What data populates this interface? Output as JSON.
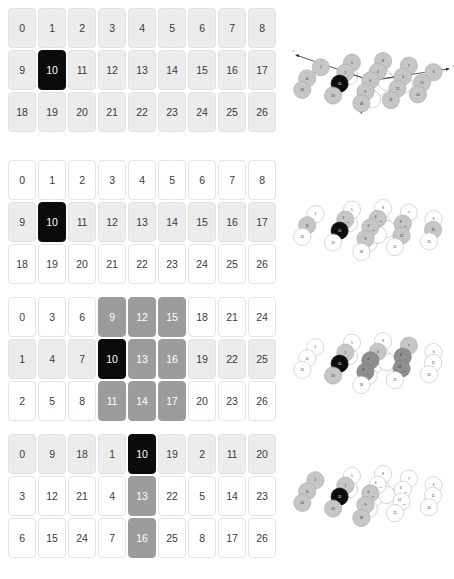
{
  "panels": [
    {
      "id": "panel-1",
      "order": "row-major-x",
      "rows": [
        [
          {
            "v": "0",
            "s": "lite"
          },
          {
            "v": "1",
            "s": "lite"
          },
          {
            "v": "2",
            "s": "lite"
          },
          {
            "v": "3",
            "s": "lite"
          },
          {
            "v": "4",
            "s": "lite"
          },
          {
            "v": "5",
            "s": "lite"
          },
          {
            "v": "6",
            "s": "lite"
          },
          {
            "v": "7",
            "s": "lite"
          },
          {
            "v": "8",
            "s": "lite"
          }
        ],
        [
          {
            "v": "9",
            "s": "lite"
          },
          {
            "v": "10",
            "s": "dark"
          },
          {
            "v": "11",
            "s": "lite"
          },
          {
            "v": "12",
            "s": "lite"
          },
          {
            "v": "13",
            "s": "lite"
          },
          {
            "v": "14",
            "s": "lite"
          },
          {
            "v": "15",
            "s": "lite"
          },
          {
            "v": "16",
            "s": "lite"
          },
          {
            "v": "17",
            "s": "lite"
          }
        ],
        [
          {
            "v": "18",
            "s": "lite"
          },
          {
            "v": "19",
            "s": "lite"
          },
          {
            "v": "20",
            "s": "lite"
          },
          {
            "v": "21",
            "s": "lite"
          },
          {
            "v": "22",
            "s": "lite"
          },
          {
            "v": "23",
            "s": "lite"
          },
          {
            "v": "24",
            "s": "lite"
          },
          {
            "v": "25",
            "s": "lite"
          },
          {
            "v": "26",
            "s": "lite"
          }
        ]
      ]
    },
    {
      "id": "panel-2",
      "order": "row-major-x",
      "rows": [
        [
          {
            "v": "0",
            "s": "plain"
          },
          {
            "v": "1",
            "s": "plain"
          },
          {
            "v": "2",
            "s": "plain"
          },
          {
            "v": "3",
            "s": "plain"
          },
          {
            "v": "4",
            "s": "plain"
          },
          {
            "v": "5",
            "s": "plain"
          },
          {
            "v": "6",
            "s": "plain"
          },
          {
            "v": "7",
            "s": "plain"
          },
          {
            "v": "8",
            "s": "plain"
          }
        ],
        [
          {
            "v": "9",
            "s": "lite"
          },
          {
            "v": "10",
            "s": "dark"
          },
          {
            "v": "11",
            "s": "lite"
          },
          {
            "v": "12",
            "s": "lite"
          },
          {
            "v": "13",
            "s": "lite"
          },
          {
            "v": "14",
            "s": "lite"
          },
          {
            "v": "15",
            "s": "lite"
          },
          {
            "v": "16",
            "s": "lite"
          },
          {
            "v": "17",
            "s": "lite"
          }
        ],
        [
          {
            "v": "18",
            "s": "plain"
          },
          {
            "v": "19",
            "s": "plain"
          },
          {
            "v": "20",
            "s": "plain"
          },
          {
            "v": "21",
            "s": "plain"
          },
          {
            "v": "22",
            "s": "plain"
          },
          {
            "v": "23",
            "s": "plain"
          },
          {
            "v": "24",
            "s": "plain"
          },
          {
            "v": "25",
            "s": "plain"
          },
          {
            "v": "26",
            "s": "plain"
          }
        ]
      ]
    },
    {
      "id": "panel-3",
      "order": "column-major",
      "rows": [
        [
          {
            "v": "0",
            "s": "plain"
          },
          {
            "v": "3",
            "s": "plain"
          },
          {
            "v": "6",
            "s": "plain"
          },
          {
            "v": "9",
            "s": "mid"
          },
          {
            "v": "12",
            "s": "mid"
          },
          {
            "v": "15",
            "s": "mid"
          },
          {
            "v": "18",
            "s": "plain"
          },
          {
            "v": "21",
            "s": "plain"
          },
          {
            "v": "24",
            "s": "plain"
          }
        ],
        [
          {
            "v": "1",
            "s": "lite"
          },
          {
            "v": "4",
            "s": "lite"
          },
          {
            "v": "7",
            "s": "lite"
          },
          {
            "v": "10",
            "s": "dark"
          },
          {
            "v": "13",
            "s": "mid"
          },
          {
            "v": "16",
            "s": "mid"
          },
          {
            "v": "19",
            "s": "lite"
          },
          {
            "v": "22",
            "s": "lite"
          },
          {
            "v": "25",
            "s": "lite"
          }
        ],
        [
          {
            "v": "2",
            "s": "plain"
          },
          {
            "v": "5",
            "s": "plain"
          },
          {
            "v": "8",
            "s": "plain"
          },
          {
            "v": "11",
            "s": "mid"
          },
          {
            "v": "14",
            "s": "mid"
          },
          {
            "v": "17",
            "s": "mid"
          },
          {
            "v": "20",
            "s": "plain"
          },
          {
            "v": "23",
            "s": "plain"
          },
          {
            "v": "26",
            "s": "plain"
          }
        ]
      ]
    },
    {
      "id": "panel-4",
      "order": "depth-major",
      "rows": [
        [
          {
            "v": "0",
            "s": "lite"
          },
          {
            "v": "9",
            "s": "lite"
          },
          {
            "v": "18",
            "s": "lite"
          },
          {
            "v": "1",
            "s": "lite"
          },
          {
            "v": "10",
            "s": "dark"
          },
          {
            "v": "19",
            "s": "lite"
          },
          {
            "v": "2",
            "s": "lite"
          },
          {
            "v": "11",
            "s": "lite"
          },
          {
            "v": "20",
            "s": "lite"
          }
        ],
        [
          {
            "v": "3",
            "s": "plain"
          },
          {
            "v": "12",
            "s": "plain"
          },
          {
            "v": "21",
            "s": "plain"
          },
          {
            "v": "4",
            "s": "plain"
          },
          {
            "v": "13",
            "s": "mid"
          },
          {
            "v": "22",
            "s": "plain"
          },
          {
            "v": "5",
            "s": "plain"
          },
          {
            "v": "14",
            "s": "plain"
          },
          {
            "v": "23",
            "s": "plain"
          }
        ],
        [
          {
            "v": "6",
            "s": "plain"
          },
          {
            "v": "15",
            "s": "plain"
          },
          {
            "v": "24",
            "s": "plain"
          },
          {
            "v": "7",
            "s": "plain"
          },
          {
            "v": "16",
            "s": "mid"
          },
          {
            "v": "25",
            "s": "plain"
          },
          {
            "v": "8",
            "s": "plain"
          },
          {
            "v": "17",
            "s": "plain"
          },
          {
            "v": "26",
            "s": "plain"
          }
        ]
      ]
    }
  ],
  "axes": {
    "x": "x",
    "y": "Y",
    "z": "z"
  },
  "diagrams": [
    {
      "id": "diagram-1",
      "has_axes": true,
      "nodes": [
        {
          "id": "8",
          "x": 227,
          "y": 29,
          "s": "lite"
        },
        {
          "id": "5",
          "x": 151,
          "y": 33,
          "s": "lite"
        },
        {
          "id": "7",
          "x": 290,
          "y": 40,
          "s": "lite"
        },
        {
          "id": "2",
          "x": 75,
          "y": 44,
          "s": "lite"
        },
        {
          "id": "4",
          "x": 214,
          "y": 55,
          "s": "lite"
        },
        {
          "id": "1",
          "x": 135,
          "y": 57,
          "s": "lite"
        },
        {
          "id": "6",
          "x": 350,
          "y": 56,
          "s": "lite"
        },
        {
          "id": "3",
          "x": 275,
          "y": 67,
          "s": "lite"
        },
        {
          "id": "0",
          "x": 196,
          "y": 76,
          "s": "lite"
        },
        {
          "id": "11",
          "x": 42,
          "y": 71,
          "s": "lite"
        },
        {
          "id": "10",
          "x": 121,
          "y": 84,
          "s": "blk"
        },
        {
          "id": "15",
          "x": 322,
          "y": 82,
          "s": "lite"
        },
        {
          "id": "12",
          "x": 262,
          "y": 96,
          "s": "lite"
        },
        {
          "id": "9",
          "x": 184,
          "y": 104,
          "s": "lite"
        },
        {
          "id": "20",
          "x": 30,
          "y": 99,
          "s": "lite"
        },
        {
          "id": "19",
          "x": 105,
          "y": 113,
          "s": "lite"
        },
        {
          "id": "24",
          "x": 312,
          "y": 110,
          "s": "lite"
        },
        {
          "id": "21",
          "x": 246,
          "y": 124,
          "s": "lite"
        },
        {
          "id": "18",
          "x": 174,
          "y": 132,
          "s": "lite"
        }
      ],
      "ghosts": [
        {
          "x": 222,
          "y": 64
        },
        {
          "x": 230,
          "y": 72
        },
        {
          "x": 206,
          "y": 86
        },
        {
          "x": 214,
          "y": 94
        },
        {
          "x": 270,
          "y": 78
        },
        {
          "x": 278,
          "y": 86
        },
        {
          "x": 192,
          "y": 114
        },
        {
          "x": 200,
          "y": 122
        },
        {
          "x": 144,
          "y": 66
        },
        {
          "x": 236,
          "y": 80
        }
      ]
    },
    {
      "id": "diagram-2",
      "has_axes": false,
      "nodes": [
        {
          "id": "8",
          "x": 227,
          "y": 29,
          "s": "plain"
        },
        {
          "id": "5",
          "x": 151,
          "y": 33,
          "s": "plain"
        },
        {
          "id": "7",
          "x": 290,
          "y": 40,
          "s": "plain"
        },
        {
          "id": "2",
          "x": 62,
          "y": 44,
          "s": "plain"
        },
        {
          "id": "4",
          "x": 214,
          "y": 55,
          "s": "lite",
          "sub": "17"
        },
        {
          "id": "1",
          "x": 135,
          "y": 57,
          "s": "lite",
          "sub": "14"
        },
        {
          "id": "6",
          "x": 350,
          "y": 56,
          "s": "plain"
        },
        {
          "id": "3",
          "x": 275,
          "y": 67,
          "s": "lite",
          "sub": "16"
        },
        {
          "id": "0",
          "x": 196,
          "y": 76,
          "s": "lite",
          "sub": "13"
        },
        {
          "id": "11",
          "x": 42,
          "y": 71,
          "s": "lite"
        },
        {
          "id": "10",
          "x": 121,
          "y": 84,
          "s": "blk"
        },
        {
          "id": "15",
          "x": 349,
          "y": 82,
          "s": "lite"
        },
        {
          "id": "12",
          "x": 272,
          "y": 96,
          "s": "lite"
        },
        {
          "id": "9",
          "x": 184,
          "y": 104,
          "s": "lite"
        },
        {
          "id": "20",
          "x": 30,
          "y": 99,
          "s": "plain"
        },
        {
          "id": "19",
          "x": 105,
          "y": 113,
          "s": "plain"
        },
        {
          "id": "24",
          "x": 339,
          "y": 110,
          "s": "plain"
        },
        {
          "id": "21",
          "x": 256,
          "y": 124,
          "s": "plain"
        },
        {
          "id": "18",
          "x": 174,
          "y": 136,
          "s": "plain"
        }
      ],
      "ghosts": [
        {
          "x": 222,
          "y": 64
        },
        {
          "x": 206,
          "y": 86
        },
        {
          "x": 270,
          "y": 78
        },
        {
          "x": 192,
          "y": 114
        },
        {
          "x": 144,
          "y": 66
        },
        {
          "x": 236,
          "y": 80
        },
        {
          "x": 214,
          "y": 94
        }
      ]
    },
    {
      "id": "diagram-3",
      "has_axes": false,
      "nodes": [
        {
          "id": "8",
          "x": 227,
          "y": 29,
          "s": "plain"
        },
        {
          "id": "5",
          "x": 151,
          "y": 33,
          "s": "plain"
        },
        {
          "id": "7",
          "x": 290,
          "y": 40,
          "s": "lite"
        },
        {
          "id": "2",
          "x": 62,
          "y": 44,
          "s": "plain"
        },
        {
          "id": "4",
          "x": 214,
          "y": 55,
          "s": "lite"
        },
        {
          "id": "1",
          "x": 135,
          "y": 57,
          "s": "lite"
        },
        {
          "id": "6",
          "x": 350,
          "y": 56,
          "s": "plain"
        },
        {
          "id": "3",
          "x": 275,
          "y": 67,
          "s": "mid",
          "sub": "6"
        },
        {
          "id": "0",
          "x": 196,
          "y": 76,
          "s": "mid",
          "sub": "4"
        },
        {
          "id": "11",
          "x": 42,
          "y": 71,
          "s": "plain"
        },
        {
          "id": "10",
          "x": 121,
          "y": 84,
          "s": "blk"
        },
        {
          "id": "15",
          "x": 349,
          "y": 82,
          "s": "plain"
        },
        {
          "id": "12",
          "x": 272,
          "y": 96,
          "s": "mid",
          "sub": "28"
        },
        {
          "id": "9",
          "x": 184,
          "y": 104,
          "s": "mid",
          "sub": "24"
        },
        {
          "id": "20",
          "x": 30,
          "y": 99,
          "s": "plain"
        },
        {
          "id": "19",
          "x": 105,
          "y": 113,
          "s": "lite"
        },
        {
          "id": "24",
          "x": 339,
          "y": 110,
          "s": "plain"
        },
        {
          "id": "21",
          "x": 256,
          "y": 124,
          "s": "plain"
        },
        {
          "id": "18",
          "x": 174,
          "y": 136,
          "s": "plain"
        }
      ],
      "ghosts": [
        {
          "x": 222,
          "y": 64
        },
        {
          "x": 206,
          "y": 86
        },
        {
          "x": 270,
          "y": 78
        },
        {
          "x": 192,
          "y": 114
        },
        {
          "x": 144,
          "y": 66
        },
        {
          "x": 236,
          "y": 80
        }
      ]
    },
    {
      "id": "diagram-4",
      "has_axes": false,
      "nodes": [
        {
          "id": "8",
          "x": 227,
          "y": 29,
          "s": "plain"
        },
        {
          "id": "5",
          "x": 151,
          "y": 33,
          "s": "plain"
        },
        {
          "id": "7",
          "x": 290,
          "y": 40,
          "s": "plain"
        },
        {
          "id": "2",
          "x": 62,
          "y": 44,
          "s": "lite"
        },
        {
          "id": "4",
          "x": 214,
          "y": 55,
          "s": "plain",
          "sub": "17"
        },
        {
          "id": "1",
          "x": 135,
          "y": 57,
          "s": "lite"
        },
        {
          "id": "6",
          "x": 350,
          "y": 56,
          "s": "plain"
        },
        {
          "id": "3",
          "x": 275,
          "y": 67,
          "s": "plain",
          "sub": "16"
        },
        {
          "id": "0",
          "x": 196,
          "y": 76,
          "s": "lite",
          "sub": "26"
        },
        {
          "id": "11",
          "x": 42,
          "y": 71,
          "s": "lite"
        },
        {
          "id": "10",
          "x": 121,
          "y": 84,
          "s": "blk"
        },
        {
          "id": "15",
          "x": 349,
          "y": 82,
          "s": "plain"
        },
        {
          "id": "12",
          "x": 272,
          "y": 96,
          "s": "plain",
          "sub": "25"
        },
        {
          "id": "9",
          "x": 184,
          "y": 104,
          "s": "lite"
        },
        {
          "id": "20",
          "x": 30,
          "y": 99,
          "s": "lite"
        },
        {
          "id": "19",
          "x": 105,
          "y": 113,
          "s": "lite"
        },
        {
          "id": "24",
          "x": 339,
          "y": 110,
          "s": "plain"
        },
        {
          "id": "21",
          "x": 256,
          "y": 124,
          "s": "plain"
        },
        {
          "id": "18",
          "x": 174,
          "y": 136,
          "s": "lite"
        }
      ],
      "ghosts": [
        {
          "x": 222,
          "y": 64
        },
        {
          "x": 206,
          "y": 86
        },
        {
          "x": 270,
          "y": 78
        },
        {
          "x": 192,
          "y": 114
        },
        {
          "x": 144,
          "y": 66
        },
        {
          "x": 236,
          "y": 80
        }
      ]
    }
  ]
}
